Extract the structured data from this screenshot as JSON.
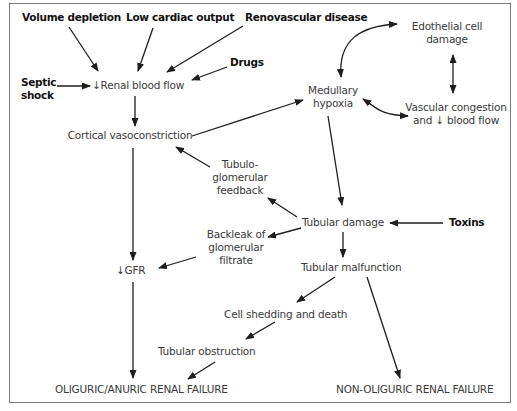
{
  "diagram": {
    "type": "flowchart",
    "topic": "Pathophysiology of acute renal failure",
    "nodes": {
      "volume_depletion": {
        "label": "Volume depletion",
        "style": "bold"
      },
      "low_cardiac_output": {
        "label": "Low cardiac output",
        "style": "bold"
      },
      "renovascular_disease": {
        "label": "Renovascular disease",
        "style": "bold"
      },
      "drugs": {
        "label": "Drugs",
        "style": "bold"
      },
      "septic_shock": {
        "line1": "Septic",
        "line2": "shock",
        "style": "bold"
      },
      "renal_blood_flow": {
        "label": "↓Renal blood flow"
      },
      "cortical_vasoconstriction": {
        "label": "Cortical vasoconstriction"
      },
      "edothelial_cell_damage": {
        "line1": "Edothelial cell",
        "line2": "damage"
      },
      "medullary_hypoxia": {
        "line1": "Medullary",
        "line2": "hypoxia"
      },
      "vascular_congestion": {
        "line1": "Vascular  congestion",
        "line2": "and ↓ blood flow"
      },
      "tubuloglomerular_feedback": {
        "line1": "Tubulo-",
        "line2": "glomerular",
        "line3": "feedback"
      },
      "tubular_damage": {
        "label": "Tubular damage"
      },
      "toxins": {
        "label": "Toxins",
        "style": "bold"
      },
      "backleak": {
        "line1": "Backleak of",
        "line2": "glomerular",
        "line3": "filtrate"
      },
      "gfr": {
        "label": "↓GFR"
      },
      "tubular_malfunction": {
        "label": "Tubular malfunction"
      },
      "cell_shedding": {
        "label": "Cell shedding and death"
      },
      "tubular_obstruction": {
        "label": "Tubular obstruction"
      },
      "oliguric_failure": {
        "label": "OLIGURIC/ANURIC RENAL FAILURE"
      },
      "non_oliguric_failure": {
        "label": "NON-OLIGURIC RENAL FAILURE"
      }
    },
    "edges": [
      {
        "from": "volume_depletion",
        "to": "renal_blood_flow"
      },
      {
        "from": "low_cardiac_output",
        "to": "renal_blood_flow"
      },
      {
        "from": "renovascular_disease",
        "to": "renal_blood_flow"
      },
      {
        "from": "drugs",
        "to": "renal_blood_flow"
      },
      {
        "from": "septic_shock",
        "to": "renal_blood_flow"
      },
      {
        "from": "renal_blood_flow",
        "to": "cortical_vasoconstriction"
      },
      {
        "from": "cortical_vasoconstriction",
        "to": "medullary_hypoxia"
      },
      {
        "from": "cortical_vasoconstriction",
        "to": "gfr"
      },
      {
        "from": "medullary_hypoxia",
        "to": "edothelial_cell_damage",
        "bidirectional": true
      },
      {
        "from": "edothelial_cell_damage",
        "to": "vascular_congestion",
        "bidirectional": true
      },
      {
        "from": "medullary_hypoxia",
        "to": "vascular_congestion",
        "bidirectional": true
      },
      {
        "from": "medullary_hypoxia",
        "to": "tubular_damage"
      },
      {
        "from": "toxins",
        "to": "tubular_damage"
      },
      {
        "from": "tubular_damage",
        "to": "tubuloglomerular_feedback"
      },
      {
        "from": "tubuloglomerular_feedback",
        "to": "cortical_vasoconstriction"
      },
      {
        "from": "tubular_damage",
        "to": "backleak"
      },
      {
        "from": "backleak",
        "to": "gfr"
      },
      {
        "from": "tubular_damage",
        "to": "tubular_malfunction"
      },
      {
        "from": "tubular_malfunction",
        "to": "cell_shedding"
      },
      {
        "from": "tubular_malfunction",
        "to": "non_oliguric_failure"
      },
      {
        "from": "cell_shedding",
        "to": "tubular_obstruction"
      },
      {
        "from": "tubular_obstruction",
        "to": "oliguric_failure"
      },
      {
        "from": "gfr",
        "to": "oliguric_failure"
      }
    ]
  }
}
